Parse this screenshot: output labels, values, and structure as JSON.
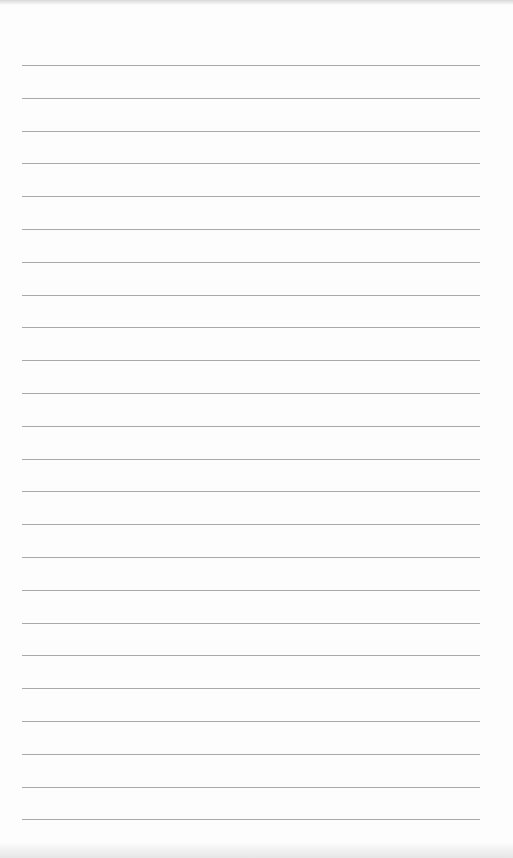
{
  "paper": {
    "type": "lined-paper",
    "line_count": 24,
    "first_line_y": 65,
    "line_spacing": 32.8,
    "line_left": 22,
    "line_width": 458,
    "line_color": "#a9a9a9",
    "background_color": "#fdfdfd"
  }
}
